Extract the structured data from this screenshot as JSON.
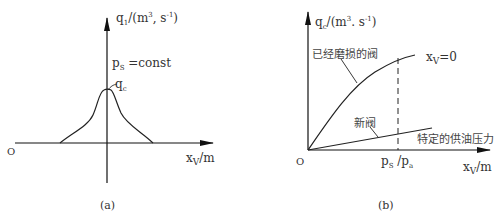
{
  "panel_a": {
    "y_axis_label": "q",
    "y_axis_label_sub": "1",
    "y_axis_unit_pre": "/(m",
    "y_axis_unit_sup1": "3",
    "y_axis_unit_mid": ", s",
    "y_axis_unit_sup2": "-1",
    "y_axis_unit_post": ")",
    "condition_p": "p",
    "condition_sub": "S",
    "condition_rest": " =const",
    "peak_label": "q",
    "peak_label_sub": "c",
    "origin": "O",
    "x_axis_label": "x",
    "x_axis_label_sub": "V",
    "x_axis_unit": "/m",
    "caption": "(a)"
  },
  "panel_b": {
    "y_axis_label": "q",
    "y_axis_label_sub": "c",
    "y_axis_unit_pre": "/(m",
    "y_axis_unit_sup1": "3",
    "y_axis_unit_mid": ". s",
    "y_axis_unit_sup2": "-1",
    "y_axis_unit_post": ")",
    "worn_valve_label": "已经磨损的阀",
    "new_valve_label": "新阀",
    "curve_label_x": "x",
    "curve_label_sub": "V",
    "curve_label_rest": "=0",
    "supply_pressure_label": "特定的供油压力",
    "x_tick_p": "p",
    "x_tick_sub1": "S",
    "x_tick_mid": " /p",
    "x_tick_sub2": "a",
    "origin": "O",
    "x_axis_label": "x",
    "x_axis_label_sub": "V",
    "x_axis_unit": "/m",
    "caption": "(b)"
  },
  "colors": {
    "line": "#1a1a1a",
    "text": "#333333"
  }
}
